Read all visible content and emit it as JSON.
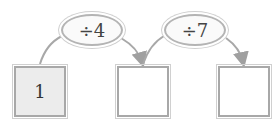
{
  "diagram": {
    "boxes": [
      {
        "value": "1",
        "filled": true
      },
      {
        "value": "",
        "filled": false
      },
      {
        "value": "",
        "filled": false
      }
    ],
    "operations": [
      {
        "label": "÷4"
      },
      {
        "label": "÷7"
      }
    ],
    "colors": {
      "line": "#a0a0a0",
      "box_fill": "#ececec",
      "text": "#333333"
    }
  }
}
